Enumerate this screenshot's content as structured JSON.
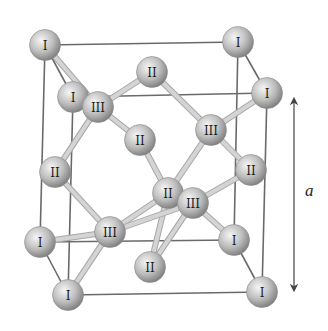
{
  "diagram": {
    "title": "",
    "dimension_label": "a",
    "colors": {
      "cube_edge": "#6a6a6a",
      "bond": "#d4d4d4",
      "atom_light": "#f4f4f4",
      "atom_dark": "#7c7c7c",
      "arrow": "#444444"
    },
    "cube": {
      "back": {
        "tl": [
          45,
          45
        ],
        "tr": [
          238,
          42
        ],
        "bl": [
          40,
          242
        ],
        "br": [
          234,
          240
        ]
      },
      "front": {
        "tl": [
          73,
          97
        ],
        "tr": [
          267,
          93
        ],
        "bl": [
          68,
          295
        ],
        "br": [
          262,
          292
        ]
      }
    },
    "atoms": [
      {
        "id": "a1",
        "label": "I",
        "x": 45,
        "y": 45
      },
      {
        "id": "a2",
        "label": "I",
        "x": 238,
        "y": 42
      },
      {
        "id": "a3",
        "label": "I",
        "x": 73,
        "y": 97
      },
      {
        "id": "a4",
        "label": "I",
        "x": 267,
        "y": 93
      },
      {
        "id": "a5",
        "label": "II",
        "x": 152,
        "y": 72
      },
      {
        "id": "a6",
        "label": "III",
        "x": 98,
        "y": 107
      },
      {
        "id": "a7",
        "label": "II",
        "x": 140,
        "y": 140
      },
      {
        "id": "a8",
        "label": "III",
        "x": 211,
        "y": 130
      },
      {
        "id": "a9",
        "label": "II",
        "x": 55,
        "y": 172
      },
      {
        "id": "a10",
        "label": "II",
        "x": 251,
        "y": 170
      },
      {
        "id": "a11",
        "label": "II",
        "x": 168,
        "y": 193
      },
      {
        "id": "a12",
        "label": "III",
        "x": 193,
        "y": 203
      },
      {
        "id": "a13",
        "label": "III",
        "x": 110,
        "y": 232
      },
      {
        "id": "a14",
        "label": "I",
        "x": 234,
        "y": 240
      },
      {
        "id": "a15",
        "label": "I",
        "x": 40,
        "y": 242
      },
      {
        "id": "a16",
        "label": "II",
        "x": 150,
        "y": 267
      },
      {
        "id": "a17",
        "label": "I",
        "x": 68,
        "y": 295
      },
      {
        "id": "a18",
        "label": "I",
        "x": 262,
        "y": 292
      }
    ],
    "bonds": [
      [
        "a1",
        "a6"
      ],
      [
        "a5",
        "a6"
      ],
      [
        "a6",
        "a9"
      ],
      [
        "a6",
        "a7"
      ],
      [
        "a7",
        "a11"
      ],
      [
        "a8",
        "a4"
      ],
      [
        "a8",
        "a11"
      ],
      [
        "a8",
        "a10"
      ],
      [
        "a8",
        "a5"
      ],
      [
        "a11",
        "a13"
      ],
      [
        "a11",
        "a16"
      ],
      [
        "a12",
        "a14"
      ],
      [
        "a12",
        "a10"
      ],
      [
        "a12",
        "a13"
      ],
      [
        "a13",
        "a9"
      ],
      [
        "a13",
        "a17"
      ],
      [
        "a13",
        "a15"
      ],
      [
        "a12",
        "a16"
      ]
    ],
    "arrow": {
      "x": 294,
      "y1": 97,
      "y2": 292,
      "label_x": 305,
      "label_y": 190
    }
  }
}
